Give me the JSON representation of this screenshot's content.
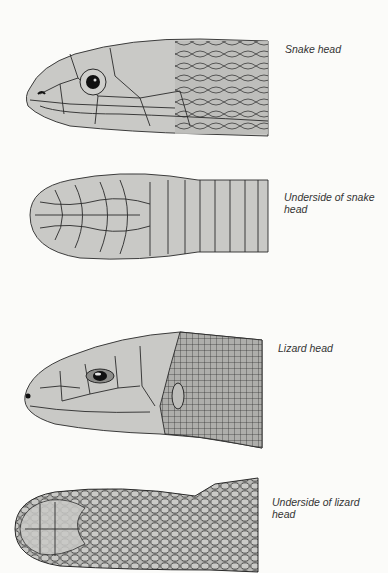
{
  "figures": [
    {
      "id": "snake-head",
      "caption": "Snake head"
    },
    {
      "id": "snake-underside",
      "caption_line1": "Underside of snake",
      "caption_line2": "head"
    },
    {
      "id": "lizard-head",
      "caption": "Lizard head"
    },
    {
      "id": "lizard-underside",
      "caption_line1": "Underside of lizard",
      "caption_line2": "head"
    }
  ],
  "colors": {
    "background": "#fbfbf9",
    "scale_fill": "#c9c9c6",
    "outline": "#2a2a2a"
  }
}
